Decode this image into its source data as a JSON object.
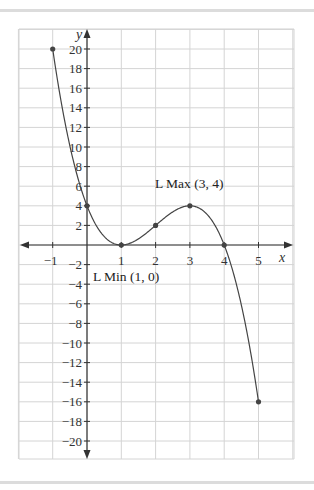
{
  "chart_data": {
    "type": "line",
    "title": "",
    "xlabel": "x",
    "ylabel": "y",
    "xlim": [
      -2,
      6
    ],
    "ylim": [
      -22,
      22
    ],
    "grid": true,
    "x_ticks": [
      -1,
      1,
      2,
      3,
      4,
      5
    ],
    "x_tick_labels": [
      "−1",
      "1",
      "2",
      "3",
      "4",
      "5"
    ],
    "y_ticks": [
      20,
      18,
      16,
      14,
      12,
      10,
      8,
      6,
      4,
      2,
      -2,
      -4,
      -6,
      -8,
      -10,
      -12,
      -14,
      -16,
      -18,
      -20
    ],
    "y_tick_labels": [
      "20",
      "18",
      "16",
      "14",
      "12",
      "10",
      "8",
      "6",
      "4",
      "2",
      "−2",
      "−4",
      "−6",
      "−8",
      "−10",
      "−12",
      "−14",
      "−16",
      "−18",
      "−20"
    ],
    "function": "y = -(x-1)^2 (x-4)",
    "domain": [
      -1,
      5
    ],
    "series": [
      {
        "name": "f(x)",
        "x": [
          -1,
          0,
          1,
          2,
          3,
          4,
          5
        ],
        "values": [
          20,
          4,
          0,
          2,
          4,
          0,
          -16
        ]
      }
    ],
    "marked_points": [
      {
        "x": -1,
        "y": 20
      },
      {
        "x": 0,
        "y": 4
      },
      {
        "x": 1,
        "y": 0
      },
      {
        "x": 2,
        "y": 2
      },
      {
        "x": 3,
        "y": 4
      },
      {
        "x": 4,
        "y": 0
      },
      {
        "x": 5,
        "y": -16
      }
    ],
    "annotations": [
      {
        "text": "L Max (3, 4)",
        "x": 3,
        "y": 4
      },
      {
        "text": "L Min (1, 0)",
        "x": 1,
        "y": 0
      }
    ]
  },
  "labels": {
    "x_axis": "x",
    "y_axis": "y",
    "local_max": "L Max (3, 4)",
    "local_min": "L Min (1, 0)"
  },
  "colors": {
    "grid": "#d4d4d4",
    "axis": "#333333",
    "curve": "#444444",
    "point": "#444444",
    "separator": "#dcdcdc"
  }
}
